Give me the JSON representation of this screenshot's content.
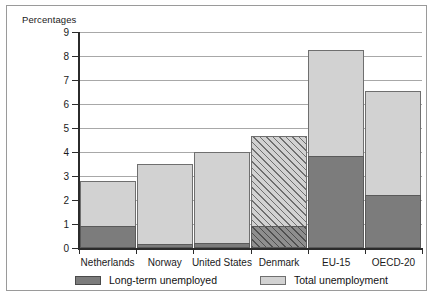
{
  "chart_data": {
    "type": "bar",
    "subtype": "stacked-bar",
    "title": "",
    "axis_note": "Percentages",
    "xlabel": "",
    "ylabel": "",
    "ylim": [
      0,
      9
    ],
    "ytick_step": 1,
    "grid": true,
    "legend_position": "bottom",
    "categories": [
      "Netherlands",
      "Norway",
      "United States",
      "Denmark",
      "EU-15",
      "OECD-20"
    ],
    "ytick_labels": [
      "9",
      "8",
      "7",
      "6",
      "5",
      "4",
      "3",
      "2",
      "1",
      "0"
    ],
    "ytick_values": [
      9,
      8,
      7,
      6,
      5,
      4,
      3,
      2,
      1,
      0
    ],
    "series": [
      {
        "name": "Long-term unemployed",
        "color": "#7c7c7c",
        "values": [
          0.9,
          0.15,
          0.22,
          0.9,
          3.85,
          2.2
        ]
      },
      {
        "name": "Total unemployment",
        "color": "#d2d2d2",
        "values": [
          2.8,
          3.48,
          3.98,
          4.68,
          8.27,
          6.55
        ]
      }
    ],
    "hatched_categories": [
      "Denmark"
    ],
    "colors": {
      "long_term": "#7c7c7c",
      "total": "#d2d2d2",
      "border": "#6f6f6f",
      "gridline": "#a8a8a8",
      "axis": "#2b2b2b",
      "frame": "#9a9a9a",
      "text": "#1a1a1a"
    }
  },
  "legend": {
    "items": [
      {
        "label": "Long-term unemployed",
        "swatch": "dark"
      },
      {
        "label": "Total unemployment",
        "swatch": "light"
      }
    ]
  }
}
